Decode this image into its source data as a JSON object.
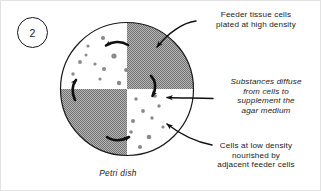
{
  "figure": {
    "number_badge": "2",
    "caption": "Petri dish",
    "dish_label": "petri-dish"
  },
  "labels": {
    "feeder": "Feeder tissue cells\nplated at high density",
    "diffuse": "Substances diffuse\nfrom cells to\nsupplement the\nagar medium",
    "low_density": "Cells at low density\nnourished by\nadjacent feeder cells"
  },
  "colors": {
    "shaded_quadrant": "#9a9a9a",
    "clear_quadrant": "#ffffff",
    "cell_dot": "#8a8a8a",
    "outline": "#1a1a1a",
    "background": "#ffffff"
  },
  "diagram": {
    "dish_center_x": 127,
    "dish_center_y": 89,
    "dish_radius": 67,
    "shaded_quadrants": [
      "top-right",
      "bottom-left"
    ],
    "clear_quadrants": [
      "top-left",
      "bottom-right"
    ],
    "diffusion_arrow_count": 4,
    "cell_dots_top_left": [
      [
        103,
        38
      ],
      [
        88,
        46
      ],
      [
        114,
        55
      ],
      [
        80,
        62
      ],
      [
        95,
        64
      ],
      [
        104,
        68
      ],
      [
        73,
        73
      ],
      [
        100,
        78
      ],
      [
        118,
        82
      ],
      [
        126,
        70
      ]
    ],
    "cell_dots_bottom_right": [
      [
        135,
        98
      ],
      [
        155,
        96
      ],
      [
        158,
        105
      ],
      [
        143,
        110
      ],
      [
        133,
        120
      ],
      [
        152,
        117
      ],
      [
        130,
        131
      ],
      [
        148,
        136
      ],
      [
        139,
        146
      ],
      [
        162,
        126
      ]
    ]
  }
}
